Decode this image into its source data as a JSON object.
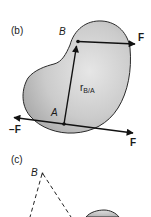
{
  "figure": {
    "panel_b": {
      "label": "(b)",
      "point_B": "B",
      "point_A": "A",
      "force_at_B": "F",
      "force_at_A": "F",
      "force_neg_at_A": "−F",
      "position_vector": {
        "symbol": "r",
        "subscript": "B/A"
      }
    },
    "panel_c": {
      "label": "(c)",
      "point_B": "B"
    },
    "colors": {
      "body_fill": "#c4c4c4",
      "body_outline": "#2a2a2a",
      "vector": "#111111",
      "background": "#ffffff"
    }
  }
}
